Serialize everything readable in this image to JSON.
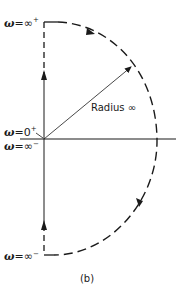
{
  "figure": {
    "caption": "(b)",
    "colors": {
      "ink": "#1a1a1a",
      "background": "#ffffff"
    },
    "labels": {
      "top": {
        "omega": "ω",
        "value": "=∞",
        "sup": "+"
      },
      "origin_pos": {
        "omega": "ω",
        "value": "=0",
        "sup": "+"
      },
      "origin_neg": {
        "omega": "ω",
        "value": "=∞",
        "sup": "−"
      },
      "bottom": {
        "omega": "ω",
        "value": "=∞",
        "sup": "−"
      },
      "radius": "Radius ∞"
    },
    "contour": {
      "description": "Nyquist contour: imaginary axis with infinite-radius semicircle in right half plane",
      "origin": [
        44,
        139
      ],
      "radius_label_position": [
        92,
        108
      ],
      "arrows": [
        "up-on-positive-imaginary-axis",
        "clockwise-on-arc-top",
        "clockwise-on-arc-bottom",
        "up-on-negative-imaginary-axis",
        "radius-vector"
      ]
    }
  }
}
